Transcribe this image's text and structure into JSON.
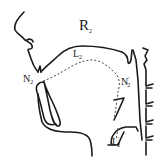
{
  "diagram": {
    "title": "R",
    "title_subscript": "2",
    "labels": [
      {
        "id": "N2",
        "text": "N",
        "sub": "2",
        "prime": ""
      },
      {
        "id": "L2",
        "text": "L",
        "sub": "2",
        "prime": ""
      },
      {
        "id": "N2p",
        "text": "N",
        "sub": "2",
        "prime": "'"
      },
      {
        "id": "L2p",
        "text": "L",
        "sub": "2",
        "prime": "'"
      }
    ],
    "colors": {
      "line": "#1a1a1a",
      "background": "#ffffff"
    }
  }
}
